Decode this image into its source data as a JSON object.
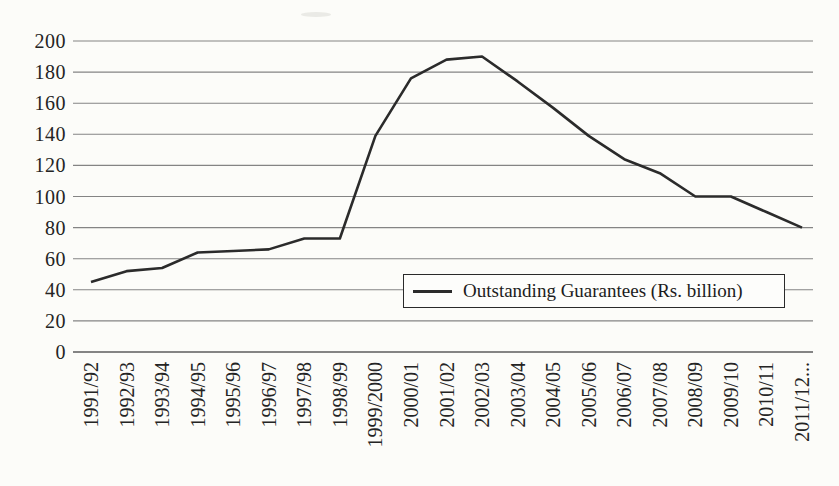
{
  "chart_data": {
    "type": "line",
    "title": "",
    "categories": [
      "1991/92",
      "1992/93",
      "1993/94",
      "1994/95",
      "1995/96",
      "1996/97",
      "1997/98",
      "1998/99",
      "1999/2000",
      "2000/01",
      "2001/02",
      "2002/03",
      "2003/04",
      "2004/05",
      "2005/06",
      "2006/07",
      "2007/08",
      "2008/09",
      "2009/10",
      "2010/11",
      "2011/12..."
    ],
    "series": [
      {
        "name": "Outstanding Guarantees (Rs. billion)",
        "values": [
          45,
          52,
          54,
          64,
          65,
          66,
          73,
          73,
          139,
          176,
          188,
          190,
          174,
          157,
          139,
          124,
          115,
          100,
          100,
          90,
          80
        ]
      }
    ],
    "xlabel": "",
    "ylabel": "",
    "ylim": [
      0,
      200
    ],
    "yticks": [
      0,
      20,
      40,
      60,
      80,
      100,
      120,
      140,
      160,
      180,
      200
    ],
    "grid": "horizontal",
    "legend_position": "inside-bottom-right"
  },
  "legend": {
    "label": "Outstanding Guarantees (Rs. billion)"
  },
  "colors": {
    "line": "#2b2b2b",
    "grid": "#848484",
    "baseline": "#5d5d5d",
    "text": "#242424",
    "background": "#fcfcf9",
    "legend_border": "#2a2a2a",
    "legend_background": "#fdfdfb"
  }
}
